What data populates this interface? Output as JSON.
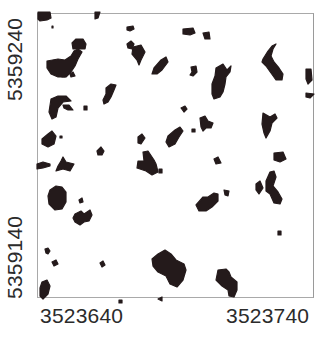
{
  "map": {
    "type": "binary-raster-map",
    "fill_color": "#241a1b",
    "frame_color": "#a9a9a9",
    "background": "#ffffff",
    "y_axis": {
      "labels": [
        {
          "text": "5359240",
          "value": 5359240
        },
        {
          "text": "5359140",
          "value": 5359140
        }
      ]
    },
    "x_axis": {
      "labels": [
        {
          "text": "3523640",
          "value": 3523640
        },
        {
          "text": "3523740",
          "value": 3523740
        }
      ]
    },
    "patches": [
      "M0,-2 L12,-2 L13,4 L9,6 L2,7 L0,5 Z",
      "M57,-2 L62,-2 L60,4 L57,5 Z",
      "M3,3 L5,3 L5,5 L3,5 Z",
      "M89,13 L95,12 L96,15 L92,17 L89,16 Z",
      "M9,47 L20,45 L27,46 L33,42 L36,37 L40,35 L44,38 L40,45 L37,52 L33,58 L28,63 L20,63 L13,60 L9,54 Z",
      "M34,29 L38,25 L45,25 L48,30 L47,35 L40,35 L35,35 Z",
      "M24,61 L27,61 L27,63 L24,63 Z",
      "M32,60 L35,58 L37,62 L33,63 Z",
      "M68,74 L73,70 L78,71 L76,76 L73,83 L70,88 L66,90 L65,86 L68,80 Z",
      "M13,85 L20,82 L28,82 L33,87 L25,88 L20,94 L18,103 L14,105 L11,98 Z",
      "M25,91 L31,91 L35,96 L30,96 L26,94 Z",
      "M46,92 L49,92 L49,96 L46,96 Z",
      "M95,33 L103,31 L107,38 L103,46 L101,51 L99,46 L94,40 Z",
      "M116,54 L123,46 L128,43 L130,48 L124,56 L119,60 L114,60 Z",
      "M10,120 L14,117 L18,122 L16,130 L10,133 L4,130 L4,125 Z",
      "M22,122 L24,122 L24,124 L22,124 Z",
      "M100,123 L104,120 L107,124 L103,130 L100,129 Z",
      "M59,137 L63,133 L66,137 L64,141 L60,141 Z",
      "M-1,150 L5,148 L12,150 L12,152 L5,154 L-1,155 Z",
      "M23,147 L25,143 L28,148 L36,150 L32,157 L25,155 L18,157 L20,152 Z",
      "M105,138 L110,137 L116,146 L118,150 L120,158 L114,161 L108,157 L99,154 L100,147 L106,147 Z",
      "M121,155 L124,155 L124,159 L121,159 Z",
      "M12,176 L18,172 L24,173 L28,178 L28,188 L24,195 L17,196 L11,190 L10,182 Z",
      "M41,186 L44,184 L45,188 L42,189 Z",
      "M37,200 L43,197 L46,200 L52,196 L54,201 L51,207 L46,208 L42,211 L37,208 L35,204 Z",
      "M7,235 L10,234 L12,237 L10,240 L8,239 Z",
      "M14,248 L18,246 L20,250 L16,252 Z",
      "M4,268 L9,266 L12,272 L10,280 L5,285 L2,282 L2,274 Z",
      "M81,286 L84,286 L84,289 L81,289 Z",
      "M89,30 L93,27 L96,30 L94,35 L90,34 Z",
      "M14,12 L15,12 L15,14 L14,14 Z",
      "M145,15 L155,14 L157,19 L152,21 L145,20 Z",
      "M165,19 L171,18 L172,25 L167,25 Z",
      "M178,54 L185,50 L189,56 L193,52 L192,58 L188,63 L187,70 L185,78 L182,83 L176,85 L174,80 L174,70 L177,62 Z",
      "M153,53 L158,52 L159,58 L155,62 L152,61 L154,58 Z",
      "M225,45 L230,37 L234,32 L238,30 L235,35 L233,42 L236,48 L241,54 L245,60 L244,66 L238,66 L233,59 L228,52 L224,48 Z",
      "M268,55 L273,55 L274,66 L270,70 L268,65 Z",
      "M268,79 L276,80 L272,84 L268,83 Z",
      "M143,94 L147,92 L149,95 L146,98 Z",
      "M162,104 L167,102 L170,107 L175,109 L173,114 L168,114 L165,117 L163,113 Z",
      "M130,122 L137,116 L142,113 L145,117 L141,123 L137,130 L131,133 L128,128 Z",
      "M154,115 L157,115 L157,118 L154,118 Z",
      "M225,99 L232,103 L237,100 L239,104 L234,109 L232,117 L228,124 L226,119 L224,110 Z",
      "M236,139 L245,138 L248,145 L242,148 L236,146 Z",
      "M176,145 L180,143 L183,149 L178,150 Z",
      "M218,170 L222,167 L225,174 L221,180 L218,176 Z",
      "M228,167 L232,158 L236,157 L238,163 L235,172 L240,178 L244,185 L242,190 L236,189 L232,180 L228,177 Z",
      "M229,169 L231,169 L231,171 L229,171 Z",
      "M165,183 L170,183 L176,179 L180,180 L180,187 L174,193 L168,197 L161,197 L158,191 Z",
      "M186,176 L191,177 L190,182 L187,181 Z",
      "M240,217 L243,217 L243,221 L240,221 Z",
      "M120,240 L127,236 L133,240 L138,246 L146,250 L148,256 L145,266 L139,273 L132,270 L128,262 L120,258 L115,252 L114,245 Z",
      "M180,256 L188,255 L191,258 L193,263 L199,268 L199,276 L196,283 L191,282 L190,276 L184,272 L178,266 Z",
      "M120,285 L124,283 L124,287 Z",
      "M62,249 L65,247 L67,251 L64,253 Z"
    ]
  }
}
